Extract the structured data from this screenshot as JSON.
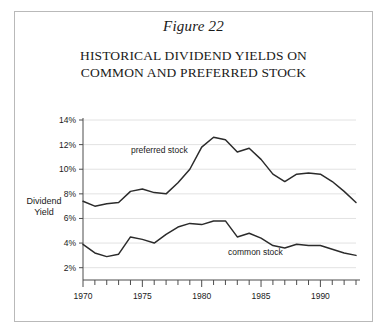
{
  "figure": {
    "caption": "Figure 22",
    "title_line1": "HISTORICAL DIVIDEND YIELDS ON",
    "title_line2": "COMMON AND PREFERRED STOCK"
  },
  "axis": {
    "y_label_line1": "Dividend",
    "y_label_line2": "Yield",
    "y_ticks": [
      "2%",
      "4%",
      "6%",
      "8%",
      "10%",
      "12%",
      "14%"
    ],
    "x_ticks": [
      "1970",
      "1975",
      "1980",
      "1985",
      "1990"
    ]
  },
  "annotations": {
    "preferred": "preferred stock",
    "common": "common stock"
  },
  "colors": {
    "line": "#2b2b2b",
    "grid": "#e2e2e2",
    "axis": "#4d4d4d",
    "frame": "#b9b9b9",
    "background": "#ffffff",
    "text": "#1a1a1a"
  },
  "chart_data": {
    "type": "line",
    "title": "HISTORICAL DIVIDEND YIELDS ON COMMON AND PREFERRED STOCK",
    "subtitle": "Figure 22",
    "xlabel": "",
    "ylabel": "Dividend Yield",
    "xlim": [
      1970,
      1993
    ],
    "ylim": [
      1,
      14
    ],
    "yticks": [
      2,
      4,
      6,
      8,
      10,
      12,
      14
    ],
    "ytick_labels": [
      "2%",
      "4%",
      "6%",
      "8%",
      "10%",
      "12%",
      "14%"
    ],
    "xticks": [
      1970,
      1975,
      1980,
      1985,
      1990
    ],
    "xtick_minor_step": 1,
    "grid": "horizontal",
    "legend": "inline-annotations",
    "x": [
      1970,
      1971,
      1972,
      1973,
      1974,
      1975,
      1976,
      1977,
      1978,
      1979,
      1980,
      1981,
      1982,
      1983,
      1984,
      1985,
      1986,
      1987,
      1988,
      1989,
      1990,
      1991,
      1992,
      1993
    ],
    "series": [
      {
        "name": "preferred stock",
        "values": [
          7.4,
          7.0,
          7.2,
          7.3,
          8.2,
          8.4,
          8.1,
          8.0,
          8.9,
          10.0,
          11.8,
          12.6,
          12.4,
          11.4,
          11.7,
          10.8,
          9.6,
          9.0,
          9.6,
          9.7,
          9.6,
          9.0,
          8.2,
          7.3
        ]
      },
      {
        "name": "common stock",
        "values": [
          3.9,
          3.2,
          2.9,
          3.1,
          4.5,
          4.3,
          4.0,
          4.7,
          5.3,
          5.6,
          5.5,
          5.8,
          5.8,
          4.5,
          4.8,
          4.4,
          3.8,
          3.6,
          3.9,
          3.8,
          3.8,
          3.5,
          3.2,
          3.0
        ]
      }
    ]
  },
  "plot_geometry": {
    "left": 83,
    "right": 356,
    "top": 120,
    "bottom": 280,
    "y_value_top": 14,
    "y_value_bottom": 1
  }
}
